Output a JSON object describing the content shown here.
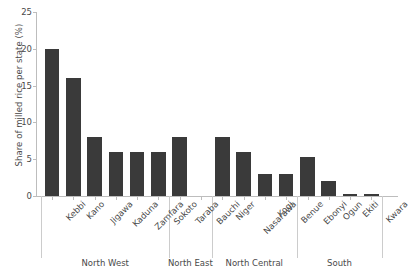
{
  "chart_data": {
    "type": "bar",
    "title": "",
    "xlabel": "",
    "ylabel": "Share of milled rice per state (%)",
    "ylim": [
      0,
      25
    ],
    "yticks": [
      0,
      5,
      10,
      15,
      20,
      25
    ],
    "grid": false,
    "legend": null,
    "bar_color": "#3a3a3a",
    "axis_color": "#bdbdbd",
    "categories": [
      "Kebbi",
      "Kano",
      "Jigawa",
      "Kaduna",
      "Zamfara",
      "Sokoto",
      "Taraba",
      "Bauchi",
      "Niger",
      "Nasarawa",
      "Kogi",
      "Benue",
      "Ebonyi",
      "Ogun",
      "Ekiti",
      "Kwara"
    ],
    "values": [
      20,
      16,
      8,
      6,
      6,
      6,
      8,
      0,
      8,
      6,
      3,
      3,
      5.3,
      2,
      0.3,
      0.3
    ],
    "groups": [
      {
        "label": "North West",
        "start": 0,
        "end": 5
      },
      {
        "label": "North East",
        "start": 6,
        "end": 7
      },
      {
        "label": "North Central",
        "start": 8,
        "end": 11
      },
      {
        "label": "South",
        "start": 12,
        "end": 15
      }
    ]
  }
}
